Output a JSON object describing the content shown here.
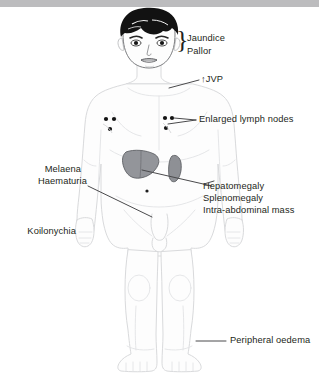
{
  "figure": {
    "background_color": "#ffffff",
    "top_band_color": "#bcbcbe",
    "text_color": "#231f20",
    "outline_color": "#d7d8da",
    "leader_line_color": "#4a4a4c",
    "organ_color": "#8e9094",
    "hair_color": "#111111",
    "marker_color": "#1a1a1a"
  },
  "labels": {
    "jaundice": "Jaundice",
    "pallor": "Pallor",
    "jvp": "↑JVP",
    "lymph_nodes": "Enlarged lymph nodes",
    "melaena": "Melaena",
    "haematuria": "Haematuria",
    "koilonychia": "Koilonychia",
    "hepatomegaly": "Hepatomegaly",
    "splenomegaly": "Splenomegaly",
    "intra_abdominal_mass": "Intra-abdominal mass",
    "peripheral_oedema": "Peripheral oedema",
    "brace_glyph": "}"
  },
  "annotations": [
    {
      "id": "jaundice-pallor",
      "text": "Jaundice / Pallor",
      "target": "face-eyes-and-conjunctiva",
      "side": "right",
      "connector": "brace"
    },
    {
      "id": "jvp",
      "text": "↑JVP",
      "target": "neck-jugular-vein",
      "side": "right",
      "connector": "line"
    },
    {
      "id": "lymph-nodes",
      "text": "Enlarged lymph nodes",
      "target": "left-axilla-nodes",
      "side": "right",
      "connector": "line"
    },
    {
      "id": "melaena-haematuria",
      "text": "Melaena / Haematuria",
      "target": "pelvis-groin",
      "side": "left",
      "connector": "line"
    },
    {
      "id": "koilonychia",
      "text": "Koilonychia",
      "target": "hands-nails",
      "side": "left",
      "connector": "none"
    },
    {
      "id": "organomegaly",
      "text": "Hepatomegaly / Splenomegaly / Intra-abdominal mass",
      "target": "liver-and-spleen",
      "side": "right",
      "connector": "line"
    },
    {
      "id": "peripheral-oedema",
      "text": "Peripheral oedema",
      "target": "right-ankle",
      "side": "right",
      "connector": "line"
    }
  ],
  "markers": {
    "axilla_node_groups": 2,
    "nodes_per_group": 3,
    "umbilicus_dots": 1
  },
  "organs": [
    {
      "name": "liver",
      "label_ref": "hepatomegaly"
    },
    {
      "name": "spleen",
      "label_ref": "splenomegaly"
    }
  ]
}
